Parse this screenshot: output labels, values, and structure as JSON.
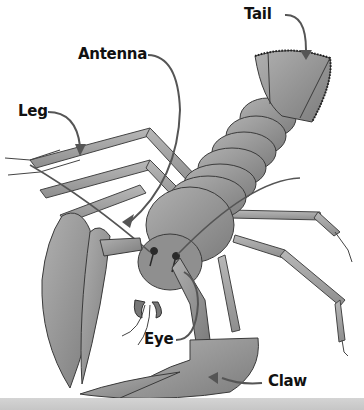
{
  "diagram": {
    "labels": [
      {
        "id": "tail",
        "text": "Tail"
      },
      {
        "id": "antenna",
        "text": "Antenna"
      },
      {
        "id": "leg",
        "text": "Leg"
      },
      {
        "id": "eye",
        "text": "Eye"
      },
      {
        "id": "claw",
        "text": "Claw"
      }
    ]
  },
  "colors": {
    "background": "#ffffff",
    "body_fill": "#9a9a9a",
    "body_dark": "#6e6e6e",
    "outline": "#3a3a3a",
    "label_text": "#111111",
    "leader_line": "#555555",
    "bottom_strip": "#cccccc"
  }
}
